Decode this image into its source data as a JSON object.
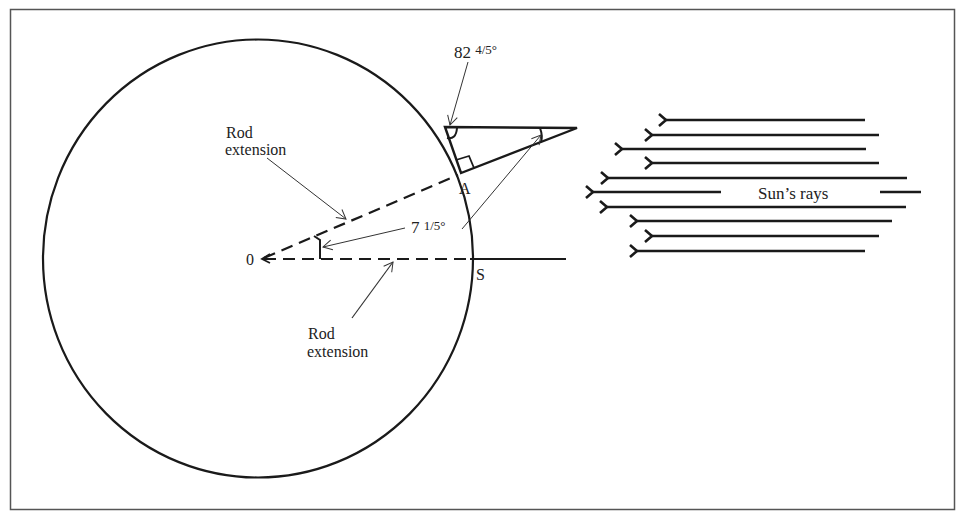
{
  "figure": {
    "colors": {
      "ink": "#1a1a1a",
      "thin": "#444444",
      "frame": "#555555",
      "background": "#ffffff"
    }
  },
  "labels": {
    "angle_top": "82 4/5°",
    "angle_top_whole": "82",
    "angle_top_frac": "4/5°",
    "angle_center": "7 1/5°",
    "angle_center_whole": "7",
    "angle_center_frac": "1/5°",
    "rod_extension_top_line1": "Rod",
    "rod_extension_top_line2": "extension",
    "rod_extension_bottom_line1": "Rod",
    "rod_extension_bottom_line2": "extension",
    "point_a": "A",
    "point_s": "S",
    "point_o": "0",
    "sun_rays": "Sun’s rays"
  },
  "geometry": {
    "circle": {
      "cx": 258,
      "cy": 258,
      "rx": 215,
      "ry": 219
    },
    "center_point": [
      262,
      259
    ],
    "point_a": [
      458,
      175
    ],
    "point_s": [
      473,
      259
    ],
    "triangle": [
      [
        445,
        127
      ],
      [
        461,
        173
      ],
      [
        577,
        128
      ]
    ],
    "sun_ray_count": 10
  }
}
